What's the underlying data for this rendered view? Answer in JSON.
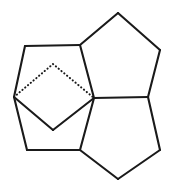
{
  "figure": {
    "background_color": "#ffffff",
    "line_color": "#1a1a1a",
    "canvas": {
      "width": 173,
      "height": 190
    },
    "solid_line_width": 2.1,
    "dotted_line_width": 2.0,
    "vertices": {
      "top_apex": {
        "name": "top-apex",
        "x": 118,
        "y": 13
      },
      "top_left_junction": {
        "name": "top-left-junction",
        "x": 80,
        "y": 45
      },
      "top_right": {
        "name": "top-right-vertex",
        "x": 160,
        "y": 50
      },
      "upper_left_corner": {
        "name": "upper-left-corner",
        "x": 25,
        "y": 46
      },
      "bridge_apex": {
        "name": "bridge-apex",
        "x": 53,
        "y": 64
      },
      "left_junction": {
        "name": "left-junction",
        "x": 14,
        "y": 97
      },
      "center_junction": {
        "name": "center-junction",
        "x": 94,
        "y": 98
      },
      "right_junction": {
        "name": "right-junction",
        "x": 148,
        "y": 97
      },
      "bridge_bottom": {
        "name": "bridge-bottom-vertex",
        "x": 53,
        "y": 130
      },
      "lower_left_corner": {
        "name": "lower-left-corner",
        "x": 27,
        "y": 150
      },
      "bottom_junction": {
        "name": "bottom-junction",
        "x": 80,
        "y": 150
      },
      "bottom_apex": {
        "name": "bottom-apex",
        "x": 118,
        "y": 179
      },
      "lower_right_corner": {
        "name": "lower-right-corner",
        "x": 160,
        "y": 150
      }
    },
    "bonds_solid": [
      {
        "name": "bond-top-apex-to-top-left-junction",
        "x1": 118,
        "y1": 13,
        "x2": 80,
        "y2": 45
      },
      {
        "name": "bond-top-apex-to-top-right",
        "x1": 118,
        "y1": 13,
        "x2": 160,
        "y2": 50
      },
      {
        "name": "bond-top-right-to-right-junction",
        "x1": 160,
        "y1": 50,
        "x2": 148,
        "y2": 97
      },
      {
        "name": "bond-top-left-junction-to-center",
        "x1": 80,
        "y1": 45,
        "x2": 94,
        "y2": 98
      },
      {
        "name": "bond-center-to-right-junction",
        "x1": 94,
        "y1": 98,
        "x2": 148,
        "y2": 97
      },
      {
        "name": "bond-right-junction-to-lower-right",
        "x1": 148,
        "y1": 97,
        "x2": 160,
        "y2": 150
      },
      {
        "name": "bond-lower-right-to-bottom-apex",
        "x1": 160,
        "y1": 150,
        "x2": 118,
        "y2": 179
      },
      {
        "name": "bond-bottom-apex-to-bottom-junction",
        "x1": 118,
        "y1": 179,
        "x2": 80,
        "y2": 150
      },
      {
        "name": "bond-bottom-junction-to-center",
        "x1": 80,
        "y1": 150,
        "x2": 94,
        "y2": 98
      },
      {
        "name": "bond-upper-left-to-top-left-junction",
        "x1": 25,
        "y1": 46,
        "x2": 80,
        "y2": 45
      },
      {
        "name": "bond-upper-left-to-left-junction",
        "x1": 25,
        "y1": 46,
        "x2": 14,
        "y2": 97
      },
      {
        "name": "bond-left-junction-to-lower-left",
        "x1": 14,
        "y1": 97,
        "x2": 27,
        "y2": 150
      },
      {
        "name": "bond-lower-left-to-bottom-junction",
        "x1": 27,
        "y1": 150,
        "x2": 80,
        "y2": 150
      },
      {
        "name": "bond-left-junction-to-bridge-bottom",
        "x1": 14,
        "y1": 97,
        "x2": 53,
        "y2": 130
      },
      {
        "name": "bond-bridge-bottom-to-center",
        "x1": 53,
        "y1": 130,
        "x2": 94,
        "y2": 98
      }
    ],
    "bonds_dotted": [
      {
        "name": "hidden-bond-left-junction-to-bridge-apex",
        "x1": 14,
        "y1": 97,
        "x2": 53,
        "y2": 64
      },
      {
        "name": "hidden-bond-bridge-apex-to-center",
        "x1": 53,
        "y1": 64,
        "x2": 94,
        "y2": 98
      }
    ],
    "rings": [
      {
        "name": "ring-top-right",
        "points": "118,13 160,50 148,97 94,98 80,45"
      },
      {
        "name": "ring-bottom-right",
        "points": "94,98 148,97 160,150 118,179 80,150"
      },
      {
        "name": "ring-left-outer",
        "points": "25,46 80,45 94,98 80,150 27,150 14,97"
      },
      {
        "name": "ring-bridge-lower",
        "points": "14,97 53,130 94,98"
      },
      {
        "name": "ring-bridge-upper",
        "points": "14,97 53,64 94,98"
      }
    ]
  }
}
